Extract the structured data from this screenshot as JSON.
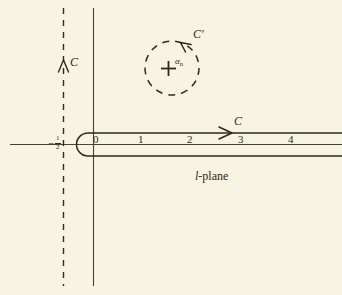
{
  "figure": {
    "plane_label": "l-plane",
    "plane_label_italic": "l",
    "plane_label_rest": "-plane",
    "background_color": "#f7f4e4",
    "ink_color": "#2b2a22",
    "axis_color": "#4a4436"
  },
  "axes": {
    "real_axis_name": "real-axis",
    "imaginary_axis_name": "imaginary-axis",
    "tick_labels": [
      "0",
      "1",
      "2",
      "3",
      "4"
    ],
    "tick_positions_px": [
      95,
      140,
      189,
      240,
      290
    ],
    "negative_half_label": {
      "minus": "−",
      "numerator": "1",
      "denominator": "2"
    }
  },
  "contours": {
    "vertical_contour": {
      "label": "C",
      "style": "dashed",
      "direction": "upward",
      "x_px": 63
    },
    "hairpin_contour": {
      "label": "C",
      "style": "solid",
      "direction": "rightward",
      "description": "hairpin around positive real axis"
    },
    "circle_contour": {
      "label": "C′",
      "style": "dashed",
      "direction": "counterclockwise",
      "center_px": [
        172,
        68
      ],
      "radius_px": 27
    }
  },
  "pole": {
    "marker": "+",
    "label_alpha": "α",
    "label_sub": "n",
    "position_px": [
      168,
      68
    ]
  }
}
